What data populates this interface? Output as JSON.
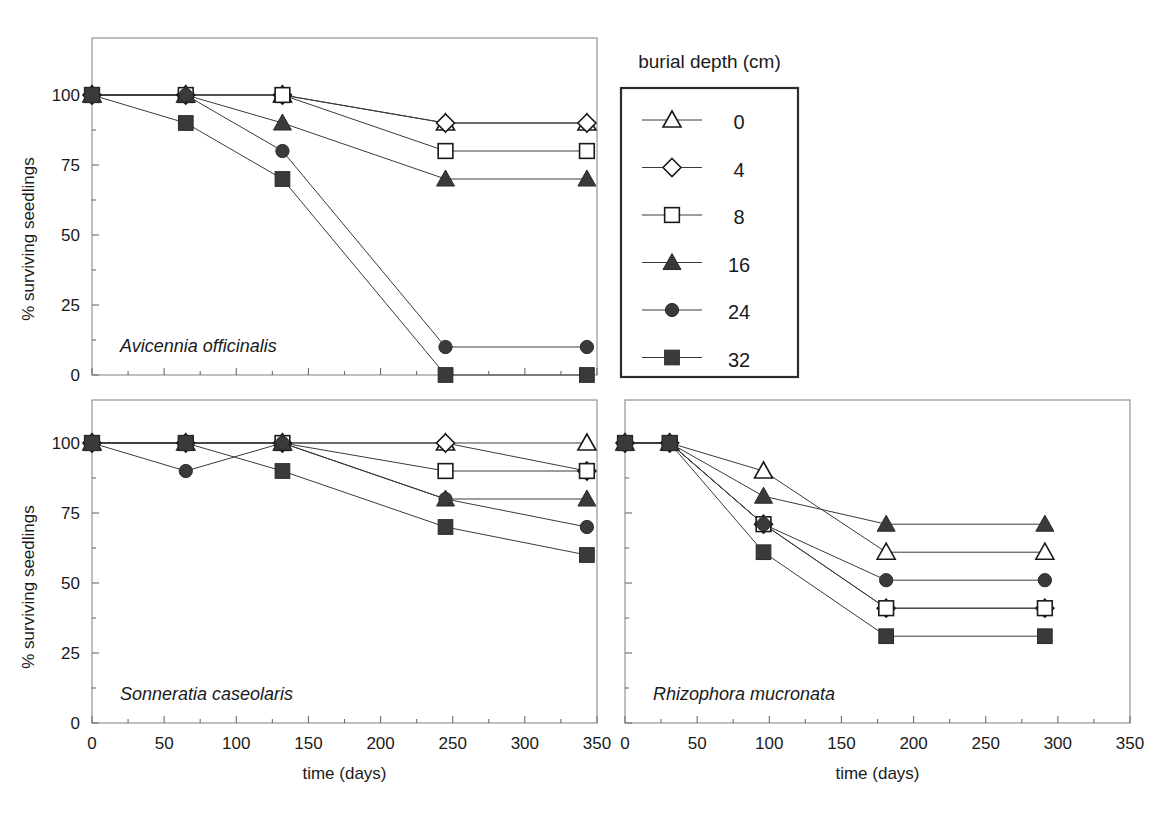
{
  "figure": {
    "axis_x_label": "time (days)",
    "axis_y_label": "% surviving seedlings",
    "legend_title": "burial depth (cm)"
  },
  "legend": {
    "title": "burial depth (cm)",
    "entries": [
      {
        "label": "0",
        "marker": "triangle-open",
        "filled": false
      },
      {
        "label": "4",
        "marker": "diamond-open",
        "filled": false
      },
      {
        "label": "8",
        "marker": "square-open",
        "filled": false
      },
      {
        "label": "16",
        "marker": "triangle-filled",
        "filled": true
      },
      {
        "label": "24",
        "marker": "circle-filled",
        "filled": true
      },
      {
        "label": "32",
        "marker": "square-filled",
        "filled": true
      }
    ]
  },
  "panels": [
    {
      "id": "avicennia",
      "species": "Avicennia officinalis",
      "show_y_labels": true,
      "show_x_labels": false
    },
    {
      "id": "sonneratia",
      "species": "Sonneratia caseolaris",
      "show_y_labels": true,
      "show_x_labels": true
    },
    {
      "id": "rhizophora",
      "species": "Rhizophora mucronata",
      "show_y_labels": false,
      "show_x_labels": true
    }
  ],
  "chart_data": [
    {
      "type": "line",
      "title": "Avicennia officinalis",
      "xlabel": "time (days)",
      "ylabel": "% surviving seedlings",
      "xlim": [
        0,
        350
      ],
      "ylim": [
        0,
        100
      ],
      "xticks": [
        0,
        50,
        100,
        150,
        200,
        250,
        300,
        350
      ],
      "yticks": [
        0,
        25,
        50,
        75,
        100
      ],
      "grid": false,
      "legend_position": "outside-top-right",
      "x": [
        0,
        65,
        132,
        245,
        343
      ],
      "series": [
        {
          "name": "0",
          "marker": "triangle-open",
          "values": [
            100,
            100,
            100,
            90,
            90
          ]
        },
        {
          "name": "4",
          "marker": "diamond-open",
          "values": [
            100,
            100,
            100,
            90,
            90
          ]
        },
        {
          "name": "8",
          "marker": "square-open",
          "values": [
            100,
            100,
            100,
            80,
            80
          ]
        },
        {
          "name": "16",
          "marker": "triangle-filled",
          "values": [
            100,
            100,
            90,
            70,
            70
          ]
        },
        {
          "name": "24",
          "marker": "circle-filled",
          "values": [
            100,
            100,
            80,
            10,
            10
          ]
        },
        {
          "name": "32",
          "marker": "square-filled",
          "values": [
            100,
            90,
            70,
            0,
            0
          ]
        }
      ]
    },
    {
      "type": "line",
      "title": "Sonneratia caseolaris",
      "xlabel": "time (days)",
      "ylabel": "% surviving seedlings",
      "xlim": [
        0,
        350
      ],
      "ylim": [
        0,
        100
      ],
      "xticks": [
        0,
        50,
        100,
        150,
        200,
        250,
        300,
        350
      ],
      "yticks": [
        0,
        25,
        50,
        75,
        100
      ],
      "grid": false,
      "x": [
        0,
        65,
        132,
        245,
        343
      ],
      "series": [
        {
          "name": "0",
          "marker": "triangle-open",
          "values": [
            100,
            100,
            100,
            100,
            100
          ]
        },
        {
          "name": "4",
          "marker": "diamond-open",
          "values": [
            100,
            100,
            100,
            100,
            90
          ]
        },
        {
          "name": "8",
          "marker": "square-open",
          "values": [
            100,
            100,
            100,
            90,
            90
          ]
        },
        {
          "name": "16",
          "marker": "triangle-filled",
          "values": [
            100,
            100,
            100,
            80,
            80
          ]
        },
        {
          "name": "24",
          "marker": "circle-filled",
          "values": [
            100,
            90,
            100,
            80,
            70
          ]
        },
        {
          "name": "32",
          "marker": "square-filled",
          "values": [
            100,
            100,
            90,
            70,
            60
          ]
        }
      ]
    },
    {
      "type": "line",
      "title": "Rhizophora mucronata",
      "xlabel": "time (days)",
      "ylabel": "% surviving seedlings",
      "xlim": [
        0,
        350
      ],
      "ylim": [
        0,
        100
      ],
      "xticks": [
        0,
        50,
        100,
        150,
        200,
        250,
        300,
        350
      ],
      "yticks": [
        0,
        25,
        50,
        75,
        100
      ],
      "grid": false,
      "x": [
        0,
        31,
        96,
        181,
        291
      ],
      "series": [
        {
          "name": "0",
          "marker": "triangle-open",
          "values": [
            100,
            100,
            90,
            61,
            61
          ]
        },
        {
          "name": "4",
          "marker": "diamond-open",
          "values": [
            100,
            100,
            71,
            41,
            41
          ]
        },
        {
          "name": "8",
          "marker": "square-open",
          "values": [
            100,
            100,
            71,
            41,
            41
          ]
        },
        {
          "name": "16",
          "marker": "triangle-filled",
          "values": [
            100,
            100,
            81,
            71,
            71
          ]
        },
        {
          "name": "24",
          "marker": "circle-filled",
          "values": [
            100,
            100,
            71,
            51,
            51
          ]
        },
        {
          "name": "32",
          "marker": "square-filled",
          "values": [
            100,
            100,
            61,
            31,
            31
          ]
        }
      ]
    }
  ]
}
